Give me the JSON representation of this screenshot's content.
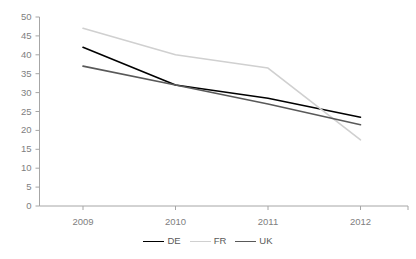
{
  "chart_data": {
    "type": "line",
    "title": "",
    "xlabel": "",
    "ylabel": "",
    "x": [
      "2009",
      "2010",
      "2011",
      "2012"
    ],
    "categories": [
      "2009",
      "2010",
      "2011",
      "2012"
    ],
    "series": [
      {
        "name": "DE",
        "color": "#000000",
        "values": [
          42,
          32,
          28.5,
          23.5
        ]
      },
      {
        "name": "FR",
        "color": "#d0d0d0",
        "values": [
          47,
          40,
          36.5,
          17.5
        ]
      },
      {
        "name": "UK",
        "color": "#595959",
        "values": [
          37,
          32,
          27,
          21.5
        ]
      }
    ],
    "ylim": [
      0,
      50
    ],
    "yticks": [
      0,
      5,
      10,
      15,
      20,
      25,
      30,
      35,
      40,
      45,
      50
    ],
    "ytick_labels": [
      "0",
      "5",
      "10",
      "15",
      "20",
      "25",
      "30",
      "35",
      "40",
      "45",
      "50"
    ],
    "xtick_labels": [
      "2009",
      "2010",
      "2011",
      "2012"
    ],
    "grid": false,
    "legend_position": "bottom",
    "legend_entries": [
      "DE",
      "FR",
      "UK"
    ],
    "axis_color": "#a6a6a6",
    "tick_label_color": "#808080"
  }
}
